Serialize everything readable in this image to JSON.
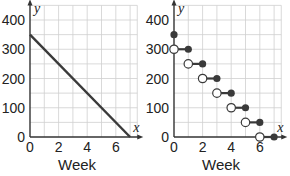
{
  "chart_data": [
    {
      "type": "line",
      "title": "",
      "xlabel": "Week",
      "ylabel": "",
      "axis_var_x": "x",
      "axis_var_y": "y",
      "xlim": [
        0,
        7.5
      ],
      "ylim": [
        0,
        450
      ],
      "x_ticks": [
        0,
        2,
        4,
        6
      ],
      "y_ticks": [
        0,
        100,
        200,
        300,
        400
      ],
      "grid": true,
      "grid_step_x": 1,
      "grid_step_y": 50,
      "series": [
        {
          "name": "continuous",
          "x": [
            0,
            7
          ],
          "y": [
            350,
            0
          ],
          "color": "#3a3a3a"
        }
      ]
    },
    {
      "type": "step",
      "title": "",
      "xlabel": "Week",
      "ylabel": "",
      "axis_var_x": "x",
      "axis_var_y": "y",
      "xlim": [
        0,
        7.5
      ],
      "ylim": [
        0,
        450
      ],
      "x_ticks": [
        0,
        2,
        4,
        6
      ],
      "y_ticks": [
        0,
        100,
        200,
        300,
        400
      ],
      "grid": true,
      "grid_step_x": 1,
      "grid_step_y": 50,
      "isolated_points": [
        {
          "x": 0,
          "y": 350,
          "closed": true
        }
      ],
      "segments": [
        {
          "x0": 0,
          "x1": 1,
          "y": 300,
          "left": "open",
          "right": "closed"
        },
        {
          "x0": 1,
          "x1": 2,
          "y": 250,
          "left": "open",
          "right": "closed"
        },
        {
          "x0": 2,
          "x1": 3,
          "y": 200,
          "left": "open",
          "right": "closed"
        },
        {
          "x0": 3,
          "x1": 4,
          "y": 150,
          "left": "open",
          "right": "closed"
        },
        {
          "x0": 4,
          "x1": 5,
          "y": 100,
          "left": "open",
          "right": "closed"
        },
        {
          "x0": 5,
          "x1": 6,
          "y": 50,
          "left": "open",
          "right": "closed"
        },
        {
          "x0": 6,
          "x1": 7,
          "y": 0,
          "left": "open",
          "right": "closed"
        }
      ],
      "color": "#3a3a3a"
    }
  ]
}
